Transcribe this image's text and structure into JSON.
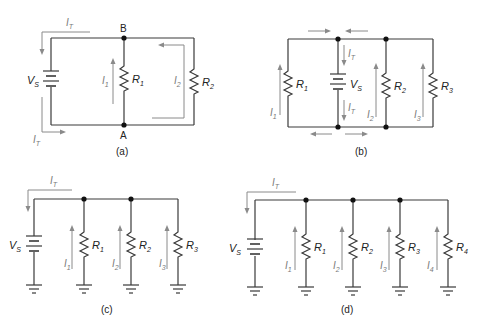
{
  "figure": {
    "panels": [
      {
        "id": "a",
        "caption": "(a)",
        "source": {
          "label": "V",
          "sub": "S"
        },
        "nodes": [
          "B",
          "A"
        ],
        "resistors": [
          {
            "label": "R",
            "sub": "1"
          },
          {
            "label": "R",
            "sub": "2"
          }
        ],
        "currents": [
          {
            "label": "I",
            "sub": "T"
          },
          {
            "label": "I",
            "sub": "T"
          },
          {
            "label": "I",
            "sub": "1"
          },
          {
            "label": "I",
            "sub": "2"
          }
        ]
      },
      {
        "id": "b",
        "caption": "(b)",
        "source": {
          "label": "V",
          "sub": "S"
        },
        "resistors": [
          {
            "label": "R",
            "sub": "1"
          },
          {
            "label": "R",
            "sub": "2"
          },
          {
            "label": "R",
            "sub": "3"
          }
        ],
        "currents": [
          {
            "label": "I",
            "sub": "T"
          },
          {
            "label": "I",
            "sub": "T"
          },
          {
            "label": "I",
            "sub": "1"
          },
          {
            "label": "I",
            "sub": "2"
          },
          {
            "label": "I",
            "sub": "3"
          }
        ]
      },
      {
        "id": "c",
        "caption": "(c)",
        "source": {
          "label": "V",
          "sub": "S"
        },
        "resistors": [
          {
            "label": "R",
            "sub": "1"
          },
          {
            "label": "R",
            "sub": "2"
          },
          {
            "label": "R",
            "sub": "3"
          }
        ],
        "currents": [
          {
            "label": "I",
            "sub": "T"
          },
          {
            "label": "I",
            "sub": "1"
          },
          {
            "label": "I",
            "sub": "2"
          },
          {
            "label": "I",
            "sub": "3"
          }
        ]
      },
      {
        "id": "d",
        "caption": "(d)",
        "source": {
          "label": "V",
          "sub": "S"
        },
        "resistors": [
          {
            "label": "R",
            "sub": "1"
          },
          {
            "label": "R",
            "sub": "2"
          },
          {
            "label": "R",
            "sub": "3"
          },
          {
            "label": "R",
            "sub": "4"
          }
        ],
        "currents": [
          {
            "label": "I",
            "sub": "T"
          },
          {
            "label": "I",
            "sub": "1"
          },
          {
            "label": "I",
            "sub": "2"
          },
          {
            "label": "I",
            "sub": "3"
          },
          {
            "label": "I",
            "sub": "4"
          }
        ]
      }
    ],
    "colors": {
      "wire": "#3a3a3a",
      "current_arrow": "#8a8a8a",
      "node": "#111111",
      "background": "#ffffff"
    }
  }
}
